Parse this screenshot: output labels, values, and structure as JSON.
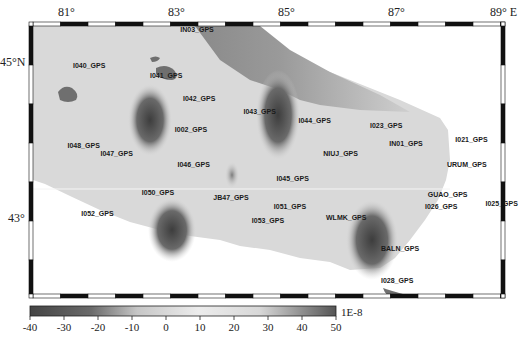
{
  "map": {
    "type": "contour-map",
    "longitude_ticks": [
      "81°",
      "83°",
      "85°",
      "87°",
      "89° E"
    ],
    "latitude_ticks": [
      "45°N",
      "43°"
    ],
    "stations": [
      {
        "name": "IN03_GPS",
        "lon": 83.1,
        "lat": 45.38
      },
      {
        "name": "I040_GPS",
        "lon": 81.15,
        "lat": 44.92
      },
      {
        "name": "I041_GPS",
        "lon": 82.55,
        "lat": 44.8
      },
      {
        "name": "I042_GPS",
        "lon": 83.15,
        "lat": 44.5
      },
      {
        "name": "I043_GPS",
        "lon": 84.25,
        "lat": 44.34
      },
      {
        "name": "I002_GPS",
        "lon": 83.0,
        "lat": 44.1
      },
      {
        "name": "I044_GPS",
        "lon": 85.25,
        "lat": 44.22
      },
      {
        "name": "I023_GPS",
        "lon": 86.55,
        "lat": 44.15
      },
      {
        "name": "I021_GPS",
        "lon": 88.1,
        "lat": 43.97
      },
      {
        "name": "IN01_GPS",
        "lon": 86.9,
        "lat": 43.93
      },
      {
        "name": "I048_GPS",
        "lon": 81.05,
        "lat": 43.9
      },
      {
        "name": "I047_GPS",
        "lon": 81.65,
        "lat": 43.8
      },
      {
        "name": "NIUJ_GPS",
        "lon": 85.7,
        "lat": 43.8
      },
      {
        "name": "I046_GPS",
        "lon": 83.05,
        "lat": 43.66
      },
      {
        "name": "URUM_GPS",
        "lon": 87.95,
        "lat": 43.66
      },
      {
        "name": "I045_GPS",
        "lon": 84.85,
        "lat": 43.47
      },
      {
        "name": "I050_GPS",
        "lon": 82.4,
        "lat": 43.3
      },
      {
        "name": "JB47_GPS",
        "lon": 83.7,
        "lat": 43.23
      },
      {
        "name": "GUAO_GPS",
        "lon": 87.6,
        "lat": 43.27
      },
      {
        "name": "I025_GPS",
        "lon": 88.65,
        "lat": 43.16
      },
      {
        "name": "I051_GPS",
        "lon": 84.8,
        "lat": 43.11
      },
      {
        "name": "I026_GPS",
        "lon": 87.55,
        "lat": 43.11
      },
      {
        "name": "I052_GPS",
        "lon": 81.3,
        "lat": 43.03
      },
      {
        "name": "WLMK_GPS",
        "lon": 85.75,
        "lat": 42.97
      },
      {
        "name": "I053_GPS",
        "lon": 84.4,
        "lat": 42.94
      },
      {
        "name": "BALN_GPS",
        "lon": 86.75,
        "lat": 42.58
      },
      {
        "name": "I028_GPS",
        "lon": 86.75,
        "lat": 42.17
      }
    ]
  },
  "colorbar": {
    "ticks": [
      "-40",
      "-30",
      "-20",
      "-10",
      "0",
      "10",
      "20",
      "30",
      "40",
      "50"
    ],
    "range": [
      -40,
      50
    ],
    "unit": "1E-8"
  },
  "colors": {
    "low": "#3a3a3a",
    "mid": "#e8e8e8",
    "high": "#555555",
    "lake": "#6f6f6f",
    "frame": "#111111"
  }
}
